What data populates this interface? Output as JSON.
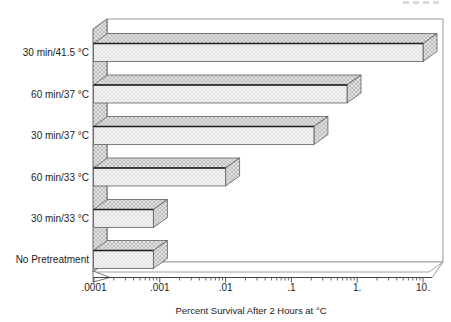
{
  "chart_data": {
    "type": "bar",
    "orientation": "horizontal",
    "effect3d": true,
    "title": "",
    "xlabel": "Percent Survival After 2 Hours at °C",
    "ylabel": "",
    "x_scale": "log",
    "xlim": [
      0.0001,
      10
    ],
    "x_ticks": [
      0.0001,
      0.001,
      0.01,
      0.1,
      1,
      10
    ],
    "x_tick_labels": [
      ".0001",
      ".001",
      ".01",
      ".1",
      "1.",
      "10."
    ],
    "categories": [
      "30 min/41.5 °C",
      "60 min/37 °C",
      "30 min/37 °C",
      "60 min/33 °C",
      "30 min/33 °C",
      "No Pretreatment"
    ],
    "values": [
      10,
      0.7,
      0.22,
      0.01,
      0.0008,
      0.0008
    ],
    "grid": false,
    "legend": "none",
    "colors": {
      "bar_front": "#f1f1f1",
      "bar_front_hatch": "#d8d8d8",
      "bar_top": "#e2e2e2",
      "bar_top_hatch": "#9f9f9f",
      "outline": "#4a4a4a",
      "edge_heavy": "#1e1e1e",
      "frame": "#9b9b9b",
      "axis": "#444444",
      "text": "#1c1c1c",
      "background": "#ffffff"
    }
  }
}
